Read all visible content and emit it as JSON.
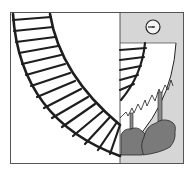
{
  "illustration": {
    "subject": "railway-track-curve-with-clock-and-trees",
    "colors": {
      "background": "#ffffff",
      "frame": "#555555",
      "track": "#1e1e1e",
      "panel": "#d6d6d6",
      "trees": "#7a7a7a",
      "tree_outline": "#2a2a2a",
      "clock_face": "#f4f4f4"
    },
    "icons": [
      "railway-track-icon",
      "clock-icon",
      "trees-icon"
    ]
  }
}
